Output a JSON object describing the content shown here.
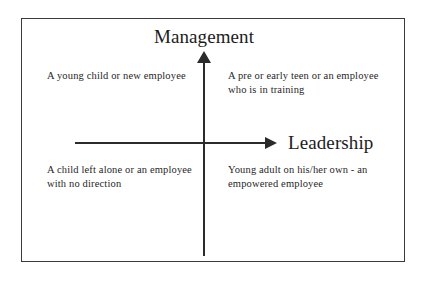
{
  "diagram": {
    "type": "quadrant-matrix",
    "axes": {
      "vertical": {
        "label": "Management",
        "direction": "up",
        "arrowhead": true
      },
      "horizontal": {
        "label": "Leadership",
        "direction": "right",
        "arrowhead": true
      }
    },
    "quadrants": {
      "top_left": {
        "position": "high management / low leadership",
        "text": "A  young child or new employee"
      },
      "top_right": {
        "position": "high management / high leadership",
        "text": "A pre or early teen or an employee who is in training"
      },
      "bottom_left": {
        "position": "low management / low leadership",
        "text": "A child left alone or an employee with no direction"
      },
      "bottom_right": {
        "position": "low management / high leadership",
        "text": "Young adult on his/her own - an empowered employee"
      }
    },
    "colors": {
      "background": "#ffffff",
      "border": "#3a3a3a",
      "axis": "#2b2b2b",
      "text": "#1f1f1f",
      "title_text": "#1c1c1c"
    }
  }
}
